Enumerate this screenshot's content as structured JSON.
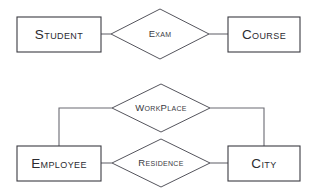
{
  "diagram": {
    "type": "er-diagram",
    "canvas": {
      "width": 314,
      "height": 191
    },
    "colors": {
      "background": "#ffffff",
      "entity_stroke": "#3b3b42",
      "relationship_stroke": "#55555d",
      "connector_stroke": "#6a6a72",
      "entity_text": "#2b2b31",
      "relationship_text": "#3a3a42"
    },
    "entities": [
      {
        "id": "student",
        "label": "Student",
        "x": 17,
        "y": 17,
        "w": 84,
        "h": 35
      },
      {
        "id": "course",
        "label": "Course",
        "x": 228,
        "y": 17,
        "w": 72,
        "h": 35
      },
      {
        "id": "employee",
        "label": "Employee",
        "x": 17,
        "y": 146,
        "w": 84,
        "h": 35
      },
      {
        "id": "city",
        "label": "City",
        "x": 228,
        "y": 146,
        "w": 72,
        "h": 35
      }
    ],
    "relationships": [
      {
        "id": "exam",
        "label": "Exam",
        "cx": 160,
        "cy": 34,
        "rx": 49,
        "ry": 25
      },
      {
        "id": "workplace",
        "label": "WorkPlace",
        "cx": 161,
        "cy": 108,
        "rx": 49,
        "ry": 24
      },
      {
        "id": "residence",
        "label": "Residence",
        "cx": 161,
        "cy": 163,
        "rx": 49,
        "ry": 24
      }
    ],
    "connections": [
      {
        "id": "student-exam",
        "from": "student",
        "to": "exam",
        "path": "M 101 34 L 111 34"
      },
      {
        "id": "exam-course",
        "from": "exam",
        "to": "course",
        "path": "M 209 34 L 228 34"
      },
      {
        "id": "employee-workplace",
        "from": "employee",
        "to": "workplace",
        "path": "M 59 146 L 59 108 L 112 108"
      },
      {
        "id": "workplace-city",
        "from": "workplace",
        "to": "city",
        "path": "M 210 108 L 264 108 L 264 146"
      },
      {
        "id": "employee-residence",
        "from": "employee",
        "to": "residence",
        "path": "M 101 163 L 112 163"
      },
      {
        "id": "residence-city",
        "from": "residence",
        "to": "city",
        "path": "M 210 163 L 228 163"
      }
    ]
  }
}
